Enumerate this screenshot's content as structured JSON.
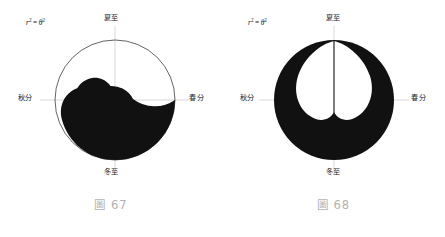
{
  "page": {
    "background_color": "#ffffff",
    "ink_color": "#111111",
    "axis_color": "#c8c8c8",
    "caption_color": "#b3b3b3"
  },
  "figures": [
    {
      "id": "figure-67",
      "equation": {
        "lhs_base": "r",
        "lhs_exp": "2",
        "operator": "=",
        "rhs_base": "θ",
        "rhs_exp": "2"
      },
      "labels": {
        "top": "夏至",
        "right": "春分",
        "bottom": "冬至",
        "left": "秋分"
      },
      "caption": "圖 67",
      "shape": "spiral-yinyang",
      "circle": {
        "cx": 115,
        "cy": 100,
        "r": 60
      }
    },
    {
      "id": "figure-68",
      "equation": {
        "lhs_base": "r",
        "lhs_exp": "2",
        "operator": "=",
        "rhs_base": "θ",
        "rhs_exp": "2"
      },
      "labels": {
        "top": "夏至",
        "right": "春分",
        "bottom": "冬至",
        "left": "秋分"
      },
      "caption": "圖 68",
      "shape": "mirrored-yinyang",
      "circle": {
        "cx": 112,
        "cy": 100,
        "r": 60
      }
    }
  ]
}
